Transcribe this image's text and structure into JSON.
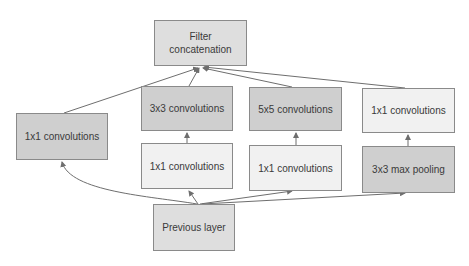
{
  "diagram": {
    "nodes": [
      {
        "id": "filter_concat",
        "label": "Filter\nconcatenation",
        "x": 154,
        "y": 20,
        "w": 93,
        "h": 46,
        "shade": "mid"
      },
      {
        "id": "left_1x1",
        "label": "1x1 convolutions",
        "x": 16,
        "y": 113,
        "w": 92,
        "h": 47,
        "shade": "dark"
      },
      {
        "id": "conv_3x3",
        "label": "3x3 convolutions",
        "x": 141,
        "y": 86,
        "w": 92,
        "h": 45,
        "shade": "dark"
      },
      {
        "id": "conv_5x5",
        "label": "5x5 convolutions",
        "x": 249,
        "y": 87,
        "w": 93,
        "h": 44,
        "shade": "dark"
      },
      {
        "id": "right_1x1",
        "label": "1x1 convolutions",
        "x": 362,
        "y": 88,
        "w": 93,
        "h": 45,
        "shade": "light"
      },
      {
        "id": "reduce_3x3",
        "label": "1x1 convolutions",
        "x": 141,
        "y": 143,
        "w": 92,
        "h": 46,
        "shade": "light"
      },
      {
        "id": "reduce_5x5",
        "label": "1x1 convolutions",
        "x": 249,
        "y": 145,
        "w": 93,
        "h": 46,
        "shade": "light"
      },
      {
        "id": "max_pool",
        "label": "3x3 max pooling",
        "x": 362,
        "y": 146,
        "w": 93,
        "h": 47,
        "shade": "dark"
      },
      {
        "id": "prev_layer",
        "label": "Previous layer",
        "x": 153,
        "y": 204,
        "w": 82,
        "h": 47,
        "shade": "mid"
      }
    ],
    "edges": [
      {
        "from": "prev_layer",
        "to": "left_1x1"
      },
      {
        "from": "prev_layer",
        "to": "reduce_3x3"
      },
      {
        "from": "prev_layer",
        "to": "reduce_5x5"
      },
      {
        "from": "prev_layer",
        "to": "max_pool"
      },
      {
        "from": "reduce_3x3",
        "to": "conv_3x3"
      },
      {
        "from": "reduce_5x5",
        "to": "conv_5x5"
      },
      {
        "from": "max_pool",
        "to": "right_1x1"
      },
      {
        "from": "left_1x1",
        "to": "filter_concat"
      },
      {
        "from": "conv_3x3",
        "to": "filter_concat"
      },
      {
        "from": "conv_5x5",
        "to": "filter_concat"
      },
      {
        "from": "right_1x1",
        "to": "filter_concat"
      }
    ],
    "colors": {
      "edge": "#6e6e6e",
      "border": "#8a8a8a",
      "text": "#3a3a3a"
    }
  }
}
